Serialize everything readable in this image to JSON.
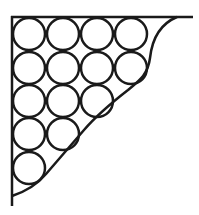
{
  "diagram": {
    "title": "",
    "stroke_color": "#1a1a1a",
    "background": "#ffffff",
    "circle_radius": 16,
    "rows": [
      {
        "cy": 34,
        "cx": [
          29,
          63,
          97,
          131
        ]
      },
      {
        "cy": 68,
        "cx": [
          29,
          63,
          97,
          131
        ]
      },
      {
        "cy": 101,
        "cx": [
          29,
          63,
          97
        ]
      },
      {
        "cy": 134,
        "cx": [
          29,
          63
        ]
      },
      {
        "cy": 168,
        "cx": [
          29
        ]
      }
    ],
    "circle_count": 14
  }
}
